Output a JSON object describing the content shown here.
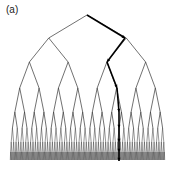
{
  "panel_label": "(a)",
  "diagram": {
    "type": "binary-tree",
    "root": [
      87,
      15
    ],
    "levels_y": [
      15,
      38,
      62,
      88,
      112,
      128,
      142,
      152,
      160
    ],
    "left_x": 10,
    "right_x": 165,
    "depth": 8,
    "highlighted_path": [
      [
        87,
        15
      ],
      [
        125,
        38
      ],
      [
        107,
        62
      ],
      [
        117,
        88
      ],
      [
        119,
        112
      ],
      [
        119,
        128
      ],
      [
        119,
        142
      ],
      [
        119,
        152
      ],
      [
        119,
        161
      ]
    ],
    "line_color": "#333333",
    "path_color": "#000000"
  }
}
